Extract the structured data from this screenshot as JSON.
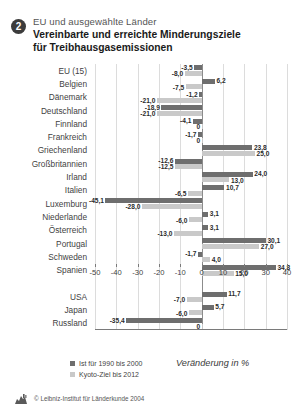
{
  "header": {
    "badge_number": "2",
    "subtitle": "EU und ausgewählte Länder",
    "title_line1": "Vereinbarte und erreichte Minderungsziele",
    "title_line2": "für Treibhausgasemissionen"
  },
  "legend": {
    "ist_label": "Ist für 1990 bis 2000",
    "ziel_label": "Kyoto-Ziel bis 2012",
    "ist_color": "#6e6e6e",
    "ziel_color": "#c9c9c9"
  },
  "axis_caption": "Veränderung in %",
  "footer": {
    "credit": "© Leibniz-Institut für Länderkunde 2004",
    "logo_name": "leibniz-institut-logo"
  },
  "chart_data": {
    "type": "bar",
    "orientation": "horizontal",
    "title": "Vereinbarte und erreichte Minderungsziele für Treibhausgasemissionen",
    "subtitle": "EU und ausgewählte Länder",
    "xlabel": "Veränderung in %",
    "ylabel": "",
    "xlim": [
      -50,
      40
    ],
    "xticks": [
      -50,
      -40,
      -30,
      -20,
      -10,
      0,
      10,
      20,
      30,
      40
    ],
    "xticklabels": [
      "-50",
      "-40",
      "-30",
      "-20",
      "-10",
      "0",
      "10",
      "20",
      "30",
      "40"
    ],
    "grid": true,
    "legend_position": "bottom-left",
    "categories": [
      "EU (15)",
      "Belgien",
      "Dänemark",
      "Deutschland",
      "Finnland",
      "Frankreich",
      "Griechenland",
      "Großbritannien",
      "Irland",
      "Italien",
      "Luxemburg",
      "Niederlande",
      "Österreich",
      "Portugal",
      "Schweden",
      "Spanien",
      "",
      "USA",
      "Japan",
      "Russland"
    ],
    "series": [
      {
        "name": "Ist für 1990 bis 2000",
        "color": "#6e6e6e",
        "values": [
          -3.5,
          6.2,
          -1.2,
          -18.9,
          -4.1,
          -1.7,
          23.8,
          -12.6,
          24.0,
          10.7,
          -45.1,
          3.1,
          3.1,
          30.1,
          -1.7,
          34.8,
          null,
          11.7,
          5.7,
          -35.4
        ]
      },
      {
        "name": "Kyoto-Ziel bis 2012",
        "color": "#c9c9c9",
        "values": [
          -8.0,
          -7.5,
          -21.0,
          -21.0,
          0,
          0,
          25.0,
          -12.5,
          13.0,
          -6.5,
          -28.0,
          -6.0,
          -13.0,
          27.0,
          4.0,
          15.0,
          null,
          -7.0,
          -6.0,
          0
        ]
      }
    ],
    "value_labels": [
      {
        "category": "EU (15)",
        "ist": "-3,5",
        "ziel": "-8,0"
      },
      {
        "category": "Belgien",
        "ist": "6,2",
        "ziel": "-7,5"
      },
      {
        "category": "Dänemark",
        "ist": "-1,2",
        "ziel": "-21,0"
      },
      {
        "category": "Deutschland",
        "ist": "-18,9",
        "ziel": "-21,0"
      },
      {
        "category": "Finnland",
        "ist": "-4,1",
        "ziel": "0"
      },
      {
        "category": "Frankreich",
        "ist": "-1,7",
        "ziel": "0"
      },
      {
        "category": "Griechenland",
        "ist": "23,8",
        "ziel": "25,0"
      },
      {
        "category": "Großbritannien",
        "ist": "-12,6",
        "ziel": "-12,5"
      },
      {
        "category": "Irland",
        "ist": "24,0",
        "ziel": "13,0"
      },
      {
        "category": "Italien",
        "ist": "10,7",
        "ziel": "-6,5"
      },
      {
        "category": "Luxemburg",
        "ist": "-45,1",
        "ziel": "-28,0"
      },
      {
        "category": "Niederlande",
        "ist": "3,1",
        "ziel": "-6,0"
      },
      {
        "category": "Österreich",
        "ist": "3,1",
        "ziel": "-13,0"
      },
      {
        "category": "Portugal",
        "ist": "30,1",
        "ziel": "27,0"
      },
      {
        "category": "Schweden",
        "ist": "-1,7",
        "ziel": "4,0"
      },
      {
        "category": "Spanien",
        "ist": "34,8",
        "ziel": "15,0"
      },
      {
        "category": "USA",
        "ist": "11,7",
        "ziel": "-7,0"
      },
      {
        "category": "Japan",
        "ist": "5,7",
        "ziel": "-6,0"
      },
      {
        "category": "Russland",
        "ist": "-35,4",
        "ziel": "0"
      }
    ]
  }
}
